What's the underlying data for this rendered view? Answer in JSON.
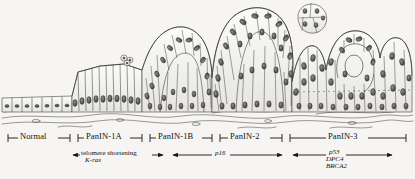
{
  "figure": {
    "type": "histology-progression-diagram",
    "background_color": "#f6f5f3",
    "ink_color": "#1a1a1a"
  },
  "axis": {
    "name": "panin-progression-axis",
    "line_y": 10,
    "stages": [
      {
        "label": "Normal",
        "x_start": 8,
        "x_end": 70,
        "label_x": 22,
        "tick_left": "bracket-right",
        "tick_right": "bracket-left"
      },
      {
        "label": "PanIN-1A",
        "x_start": 78,
        "x_end": 142,
        "label_x": 86,
        "tick_left": "bracket-right",
        "tick_right": "bracket-left"
      },
      {
        "label": "PanIN-1B",
        "x_start": 150,
        "x_end": 212,
        "label_x": 157,
        "tick_left": "bracket-right",
        "tick_right": "bracket-left"
      },
      {
        "label": "PanIN-2",
        "x_start": 220,
        "x_end": 282,
        "label_x": 231,
        "tick_left": "bracket-right",
        "tick_right": "bracket-left"
      },
      {
        "label": "PanIN-3",
        "x_start": 290,
        "x_end": 406,
        "label_x": 330,
        "tick_left": "bracket-right",
        "tick_right": "bracket-left"
      }
    ]
  },
  "gene_tracks": [
    {
      "name": "telomere-shortening-kras-track",
      "arrow_x_start": 73,
      "arrow_x_end": 163,
      "arrow_y": 27,
      "primary_label": "telomere shortening",
      "primary_style": "plain",
      "secondary_labels": [
        "K-ras"
      ],
      "secondary_style": "italic-partial",
      "label_x": 82,
      "label_y": 23
    },
    {
      "name": "p16-track",
      "arrow_x_start": 173,
      "arrow_x_end": 282,
      "arrow_y": 27,
      "primary_label": "p16",
      "primary_style": "italic",
      "secondary_labels": [],
      "label_x": 218,
      "label_y": 23
    },
    {
      "name": "p53-dpc4-brca2-track",
      "arrow_x_start": 293,
      "arrow_x_end": 392,
      "arrow_y": 27,
      "primary_label": "p53",
      "primary_style": "italic",
      "secondary_labels": [
        "DPC4",
        "BRCA2"
      ],
      "label_x": 332,
      "label_y": 22
    }
  ],
  "artwork_regions": [
    {
      "name": "normal-flat-epithelium",
      "x_start": 0,
      "x_end": 72
    },
    {
      "name": "panin1a-tall-columnar",
      "x_start": 72,
      "x_end": 142
    },
    {
      "name": "panin1b-papillary",
      "x_start": 142,
      "x_end": 212
    },
    {
      "name": "panin2-crowded-atypia",
      "x_start": 212,
      "x_end": 285
    },
    {
      "name": "panin3-carcinoma-in-situ",
      "x_start": 285,
      "x_end": 415
    },
    {
      "name": "detached-cell-cluster",
      "x_start": 295,
      "x_end": 335
    },
    {
      "name": "basement-membrane-stroma",
      "x_start": 0,
      "x_end": 415
    }
  ]
}
